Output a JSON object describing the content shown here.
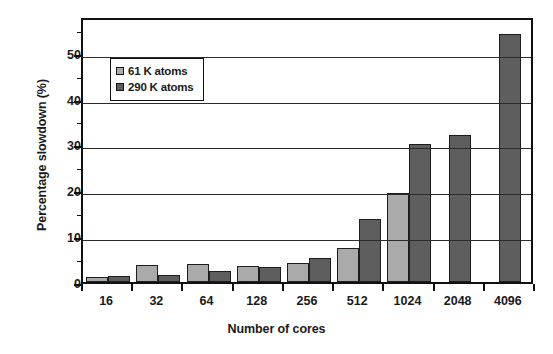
{
  "chart_data": {
    "type": "bar",
    "title": "",
    "xlabel": "Number of cores",
    "ylabel": "Percentage slowdown (%)",
    "categories": [
      "16",
      "32",
      "64",
      "128",
      "256",
      "512",
      "1024",
      "2048",
      "4096"
    ],
    "series": [
      {
        "name": "61 K atoms",
        "color": "#aaaaaa",
        "values": [
          1.1,
          3.8,
          4.0,
          3.4,
          4.2,
          7.4,
          19.5,
          null,
          null
        ]
      },
      {
        "name": "290 K atoms",
        "color": "#5e5e5e",
        "values": [
          1.4,
          1.6,
          2.4,
          3.2,
          5.2,
          13.7,
          30.0,
          32.0,
          54.0
        ]
      }
    ],
    "ylim": [
      0,
      58
    ],
    "yticks": [
      0,
      10,
      20,
      30,
      40,
      50
    ],
    "ytick_labels": [
      "0",
      "10",
      "20",
      "30",
      "40",
      "50"
    ],
    "grid": "horizontal",
    "legend_position": "upper-left-inside"
  },
  "axes": {
    "y_title": "Percentage slowdown (%)",
    "x_title": "Number of cores"
  },
  "legend": {
    "entries": [
      {
        "label": "61 K atoms",
        "swatch": "light-gray-swatch"
      },
      {
        "label": "290 K atoms",
        "swatch": "dark-gray-swatch"
      }
    ]
  },
  "colors": {
    "series_61k": "#aaaaaa",
    "series_290k": "#5e5e5e",
    "axis": "#111111",
    "background": "#ffffff"
  }
}
